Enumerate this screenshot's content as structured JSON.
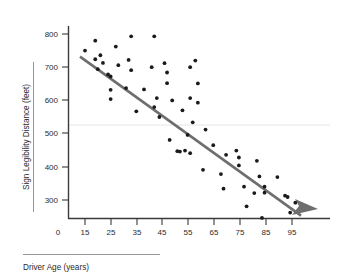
{
  "chart_data": {
    "type": "scatter",
    "title": "",
    "xlabel": "Driver Age (years)",
    "ylabel": "Sign Legibility Distance (feet)",
    "xlim": [
      0,
      103
    ],
    "ylim": [
      230,
      830
    ],
    "x_ticks": [
      15,
      25,
      35,
      45,
      55,
      65,
      75,
      85,
      95
    ],
    "y_ticks": [
      300,
      400,
      500,
      600,
      700,
      800
    ],
    "origin_label": "0",
    "grid": "single horizontal gridline at y=500",
    "gridline_values": [
      500
    ],
    "legend": "none",
    "point_color": "#1a1a1a",
    "trend_color": "#6e6e6e",
    "trend_line": {
      "label": "fitted regression line with arrowhead",
      "x_start": 15,
      "y_start": 737,
      "x_end": 100,
      "y_end": 258,
      "arrowhead": true
    },
    "points": [
      {
        "x": 15,
        "y": 750
      },
      {
        "x": 19,
        "y": 780
      },
      {
        "x": 19,
        "y": 724
      },
      {
        "x": 20,
        "y": 694
      },
      {
        "x": 21,
        "y": 736
      },
      {
        "x": 22,
        "y": 713
      },
      {
        "x": 24,
        "y": 678
      },
      {
        "x": 25,
        "y": 672
      },
      {
        "x": 25,
        "y": 632
      },
      {
        "x": 25,
        "y": 604
      },
      {
        "x": 27,
        "y": 762
      },
      {
        "x": 28,
        "y": 706
      },
      {
        "x": 31,
        "y": 637
      },
      {
        "x": 32,
        "y": 722
      },
      {
        "x": 33,
        "y": 793
      },
      {
        "x": 33,
        "y": 691
      },
      {
        "x": 35,
        "y": 567
      },
      {
        "x": 38,
        "y": 633
      },
      {
        "x": 41,
        "y": 700
      },
      {
        "x": 42,
        "y": 793
      },
      {
        "x": 42,
        "y": 580
      },
      {
        "x": 43,
        "y": 607
      },
      {
        "x": 44,
        "y": 550
      },
      {
        "x": 46,
        "y": 712
      },
      {
        "x": 47,
        "y": 684
      },
      {
        "x": 47,
        "y": 652
      },
      {
        "x": 48,
        "y": 481
      },
      {
        "x": 49,
        "y": 600
      },
      {
        "x": 51,
        "y": 447
      },
      {
        "x": 52,
        "y": 446
      },
      {
        "x": 53,
        "y": 570
      },
      {
        "x": 54,
        "y": 449
      },
      {
        "x": 55,
        "y": 496
      },
      {
        "x": 56,
        "y": 700
      },
      {
        "x": 56,
        "y": 607
      },
      {
        "x": 56,
        "y": 441
      },
      {
        "x": 57,
        "y": 534
      },
      {
        "x": 58,
        "y": 720
      },
      {
        "x": 59,
        "y": 651
      },
      {
        "x": 59,
        "y": 593
      },
      {
        "x": 61,
        "y": 391
      },
      {
        "x": 62,
        "y": 512
      },
      {
        "x": 65,
        "y": 465
      },
      {
        "x": 68,
        "y": 378
      },
      {
        "x": 69,
        "y": 334
      },
      {
        "x": 70,
        "y": 436
      },
      {
        "x": 74,
        "y": 449
      },
      {
        "x": 75,
        "y": 428
      },
      {
        "x": 75,
        "y": 404
      },
      {
        "x": 77,
        "y": 340
      },
      {
        "x": 78,
        "y": 281
      },
      {
        "x": 81,
        "y": 321
      },
      {
        "x": 82,
        "y": 418
      },
      {
        "x": 83,
        "y": 371
      },
      {
        "x": 84,
        "y": 246
      },
      {
        "x": 85,
        "y": 340
      },
      {
        "x": 85,
        "y": 322
      },
      {
        "x": 90,
        "y": 369
      },
      {
        "x": 93,
        "y": 313
      },
      {
        "x": 94,
        "y": 309
      },
      {
        "x": 95,
        "y": 262
      },
      {
        "x": 97,
        "y": 292
      }
    ]
  }
}
